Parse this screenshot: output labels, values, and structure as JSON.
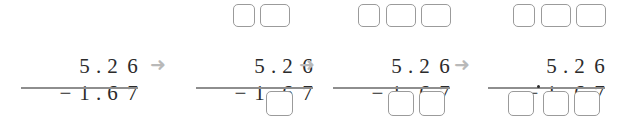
{
  "problem": {
    "minuend": "5.26",
    "subtrahend": "1.67",
    "operator": "−",
    "minuend_digits": [
      "5",
      "2",
      "6"
    ],
    "subtrahend_digits": [
      "1",
      "6",
      "7"
    ],
    "decimal_point": ".",
    "answer": ""
  },
  "colors": {
    "digit": "#2b2b2b",
    "box_border": "#9b9b9b",
    "rule": "#8e8e8e",
    "arrow": "#b9b9b9",
    "background": "#ffffff"
  },
  "arrows": {
    "glyph": "➜",
    "label": "next-step-arrow",
    "count": 3
  },
  "steps": [
    {
      "index": 1,
      "label": "step-1-initial",
      "top_boxes": [],
      "bottom_boxes": [],
      "expression_line1": "5 . 2 6",
      "expression_line2": "− 1 . 6 7"
    },
    {
      "index": 2,
      "label": "step-2-ones-place",
      "top_boxes": [
        "",
        ""
      ],
      "bottom_boxes": [
        ""
      ],
      "expression_line1": "5 . 2 6",
      "expression_line2": "− 1 . 6 7"
    },
    {
      "index": 3,
      "label": "step-3-tenths-place",
      "top_boxes": [
        "",
        "",
        ""
      ],
      "bottom_boxes": [
        "",
        ""
      ],
      "expression_line1": "5 . 2 6",
      "expression_line2": "− 1 . 6 7"
    },
    {
      "index": 4,
      "label": "step-4-whole-place",
      "top_boxes": [
        "",
        "",
        ""
      ],
      "bottom_boxes": [
        "",
        "",
        ""
      ],
      "bottom_has_decimal": true,
      "expression_line1": "5 . 2 6",
      "expression_line2": "− 1 . 6 7"
    }
  ],
  "digits": {
    "five": "5",
    "two": "2",
    "six": "6",
    "one": "1",
    "six_b": "6",
    "seven": "7",
    "dot": ".",
    "minus": "−"
  }
}
